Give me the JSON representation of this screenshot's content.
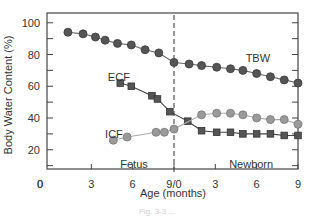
{
  "chart_data": {
    "type": "line",
    "title": "",
    "xlabel": "Age (months)",
    "ylabel": "Body Water Content (%)",
    "ylim": [
      8,
      105
    ],
    "yticks": [
      20,
      40,
      60,
      80,
      100
    ],
    "y_tick_labels": [
      "20",
      "40",
      "60",
      "80",
      "100"
    ],
    "y_origin_label": "0",
    "x_tick_labels": [
      "0",
      "3",
      "6",
      "9/0",
      "3",
      "6",
      "9"
    ],
    "x_tick_positions_months": [
      0,
      3,
      6,
      9,
      12,
      15,
      18
    ],
    "x_description": "Continuous age axis: fetal months 0-9 then newborn months 0-9 (combined scale 0-18)",
    "xlim": [
      0,
      18
    ],
    "grid": false,
    "divider": {
      "x": 9,
      "style": "dashed",
      "label": "birth"
    },
    "region_labels": [
      {
        "text": "Fetus",
        "x": 6.1,
        "y": 11
      },
      {
        "text": "Newborn",
        "x": 14.6,
        "y": 11
      }
    ],
    "series": [
      {
        "name": "TBW",
        "marker": "circle",
        "color": "#555555",
        "line_color": "#666666",
        "label_pos": {
          "x": 14.2,
          "y": 78
        },
        "x": [
          1.3,
          2.4,
          3.3,
          4.0,
          4.9,
          5.9,
          6.9,
          7.9,
          9.0,
          10.1,
          11.0,
          12.1,
          13.1,
          14.0,
          15.0,
          16.0,
          17.0,
          18.0
        ],
        "values": [
          94,
          93,
          91,
          89,
          87,
          86,
          83,
          81,
          75,
          74,
          73,
          72,
          71,
          70,
          68,
          66,
          64,
          62
        ]
      },
      {
        "name": "ECF",
        "marker": "square",
        "color": "#555555",
        "line_color": "#444444",
        "label_pos": {
          "x": 4.2,
          "y": 66
        },
        "x": [
          5.1,
          5.9,
          7.4,
          7.8,
          8.7,
          10.0,
          11.0,
          12.1,
          13.1,
          14.0,
          15.0,
          16.0,
          17.0,
          18.0
        ],
        "values": [
          62,
          60,
          54,
          52,
          44,
          38,
          32,
          31,
          31,
          30,
          30,
          30,
          29,
          29
        ]
      },
      {
        "name": "ICF",
        "marker": "circle",
        "color": "#9a9a9a",
        "line_color": "#aaaaaa",
        "label_pos": {
          "x": 4.0,
          "y": 30
        },
        "x": [
          4.6,
          5.6,
          7.7,
          8.3,
          9.0,
          11.0,
          12.1,
          13.1,
          14.0,
          15.0,
          16.0,
          17.0,
          18.0
        ],
        "values": [
          26,
          28,
          31,
          31,
          33,
          42,
          43,
          43,
          42,
          40,
          39,
          39,
          36
        ]
      }
    ]
  },
  "caption": "Fig. 3-3 ..."
}
